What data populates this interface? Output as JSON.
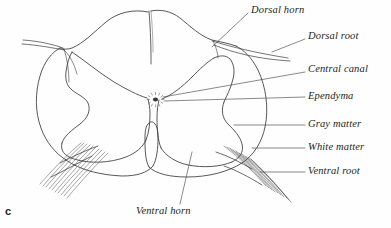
{
  "figure": {
    "panel_letter": "c",
    "background_color": "#fefefe",
    "ink_color": "#3a3a3c",
    "text_color": "#231f20"
  },
  "labels": [
    {
      "id": "dorsal-horn",
      "text": "Dorsal horn",
      "x": 251,
      "y": 5,
      "leader": {
        "x1": 248,
        "y1": 13,
        "x2": 212,
        "y2": 47
      }
    },
    {
      "id": "dorsal-root",
      "text": "Dorsal root",
      "x": 308,
      "y": 31,
      "leader": {
        "x1": 305,
        "y1": 39,
        "x2": 272,
        "y2": 52
      }
    },
    {
      "id": "central-canal",
      "text": "Central canal",
      "x": 308,
      "y": 64,
      "leader": {
        "x1": 305,
        "y1": 72,
        "x2": 163,
        "y2": 97
      }
    },
    {
      "id": "ependyma",
      "text": "Ependyma",
      "x": 308,
      "y": 91,
      "leader": {
        "x1": 305,
        "y1": 97,
        "x2": 164,
        "y2": 101
      }
    },
    {
      "id": "gray-matter",
      "text": "Gray matter",
      "x": 308,
      "y": 119,
      "leader": {
        "x1": 305,
        "y1": 125,
        "x2": 234,
        "y2": 125
      }
    },
    {
      "id": "white-matter",
      "text": "White matter",
      "x": 308,
      "y": 142,
      "leader": {
        "x1": 305,
        "y1": 148,
        "x2": 252,
        "y2": 148
      }
    },
    {
      "id": "ventral-root",
      "text": "Ventral root",
      "x": 308,
      "y": 166,
      "leader": {
        "x1": 305,
        "y1": 172,
        "x2": 260,
        "y2": 172
      }
    },
    {
      "id": "ventral-horn",
      "text": "Ventral horn",
      "x": 136,
      "y": 206,
      "leader": {
        "x1": 180,
        "y1": 204,
        "x2": 192,
        "y2": 152
      }
    }
  ],
  "structures": [
    {
      "id": "white-matter-outline",
      "name": "White matter outer boundary"
    },
    {
      "id": "gray-matter-outline",
      "name": "Gray matter butterfly"
    },
    {
      "id": "dorsal-median-sulcus",
      "name": "Dorsal median sulcus"
    },
    {
      "id": "ventral-median-fissure",
      "name": "Ventral median fissure"
    },
    {
      "id": "central-canal-dot",
      "name": "Central canal"
    },
    {
      "id": "ependyma-ring",
      "name": "Ependyma radiating ring"
    },
    {
      "id": "dorsal-root-left",
      "name": "Left dorsal root"
    },
    {
      "id": "dorsal-root-right",
      "name": "Right dorsal root"
    },
    {
      "id": "ventral-root-left",
      "name": "Left ventral rootlets"
    },
    {
      "id": "ventral-root-right",
      "name": "Right ventral rootlets"
    }
  ]
}
